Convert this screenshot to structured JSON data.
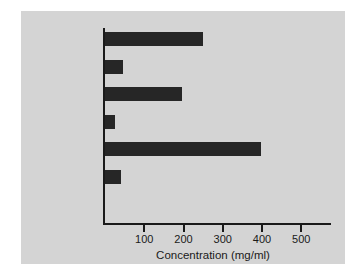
{
  "chart_data": {
    "type": "bar",
    "orientation": "horizontal",
    "title": "",
    "subtitle": "",
    "xlabel": "Concentration (mg/ml)",
    "ylabel": "",
    "categories": [
      "Tears",
      "Saliva",
      "Nasal mucus",
      "Milk",
      "Colostrum",
      "Serum"
    ],
    "values": [
      250,
      46,
      197,
      26,
      398,
      41
    ],
    "xlim": [
      0,
      580
    ],
    "xticks": [
      100,
      200,
      300,
      400,
      500
    ],
    "xtick_labels": [
      "100",
      "200",
      "300",
      "400",
      "500"
    ],
    "grid": false,
    "legend": null,
    "bar_color": "#262626",
    "background_color": "#d4d4d4",
    "axis_color": "#1a1a1a"
  },
  "figure": {
    "axis_title": "Concentration (mg/ml)",
    "rows": [
      {
        "label": "Tears",
        "value": 250
      },
      {
        "label": "Saliva",
        "value": 46
      },
      {
        "label": "Nasal mucus",
        "value": 197
      },
      {
        "label": "Milk",
        "value": 26
      },
      {
        "label": "Colostrum",
        "value": 398
      },
      {
        "label": "Serum",
        "value": 41
      }
    ],
    "ticks": [
      {
        "label": "100",
        "value": 100
      },
      {
        "label": "200",
        "value": 200
      },
      {
        "label": "300",
        "value": 300
      },
      {
        "label": "400",
        "value": 400
      },
      {
        "label": "500",
        "value": 500
      }
    ]
  }
}
